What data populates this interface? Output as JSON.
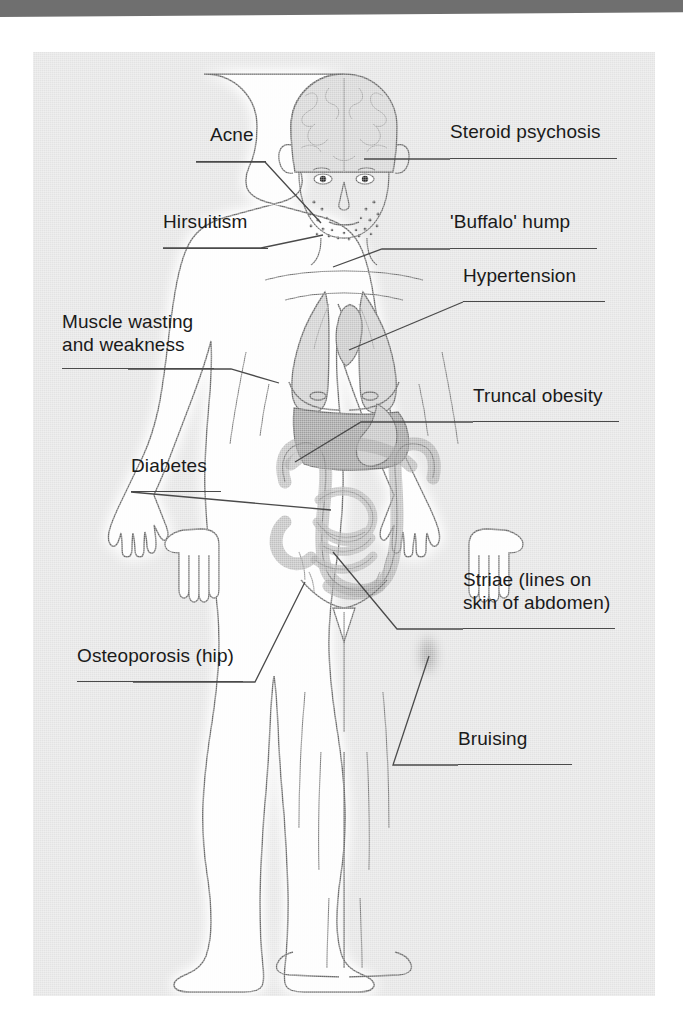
{
  "figure": {
    "kind": "annotated medical illustration",
    "panel_background": "#e3e3e3",
    "page_background": "#ffffff",
    "rule_color": "#6f6f6f",
    "ink_color": "#4a4a4a",
    "text_color": "#1a1a1a"
  },
  "labels": {
    "acne": "Acne",
    "hirsuitism": "Hirsuitism",
    "muscle_wasting_line1": "Muscle wasting",
    "muscle_wasting_line2": "and weakness",
    "diabetes": "Diabetes",
    "osteoporosis": "Osteoporosis (hip)",
    "steroid_psychosis": "Steroid psychosis",
    "buffalo_hump": "'Buffalo' hump",
    "hypertension": "Hypertension",
    "truncal_obesity": "Truncal obesity",
    "striae_line1": "Striae (lines on",
    "striae_line2": "skin of abdomen)",
    "bruising": "Bruising"
  },
  "anatomy": {
    "brain": "brain-cross-section",
    "eyes": "eyes",
    "nose": "nose",
    "mouth": "mouth",
    "acne_spots": "stippled facial spots",
    "lungs": "lungs",
    "heart": "heart",
    "liver": "liver",
    "stomach": "stomach",
    "intestines": "large and small intestine",
    "bruise": "bruise-patch-on-thigh",
    "hands": "hands",
    "feet": "feet"
  },
  "colors": {
    "organ_light": "#d2d2d2",
    "organ_mid": "#c2c2c2",
    "organ_dark": "#a8a8a8",
    "body_fill": "#fdfdfd",
    "body_outline": "#6a6a6a"
  }
}
